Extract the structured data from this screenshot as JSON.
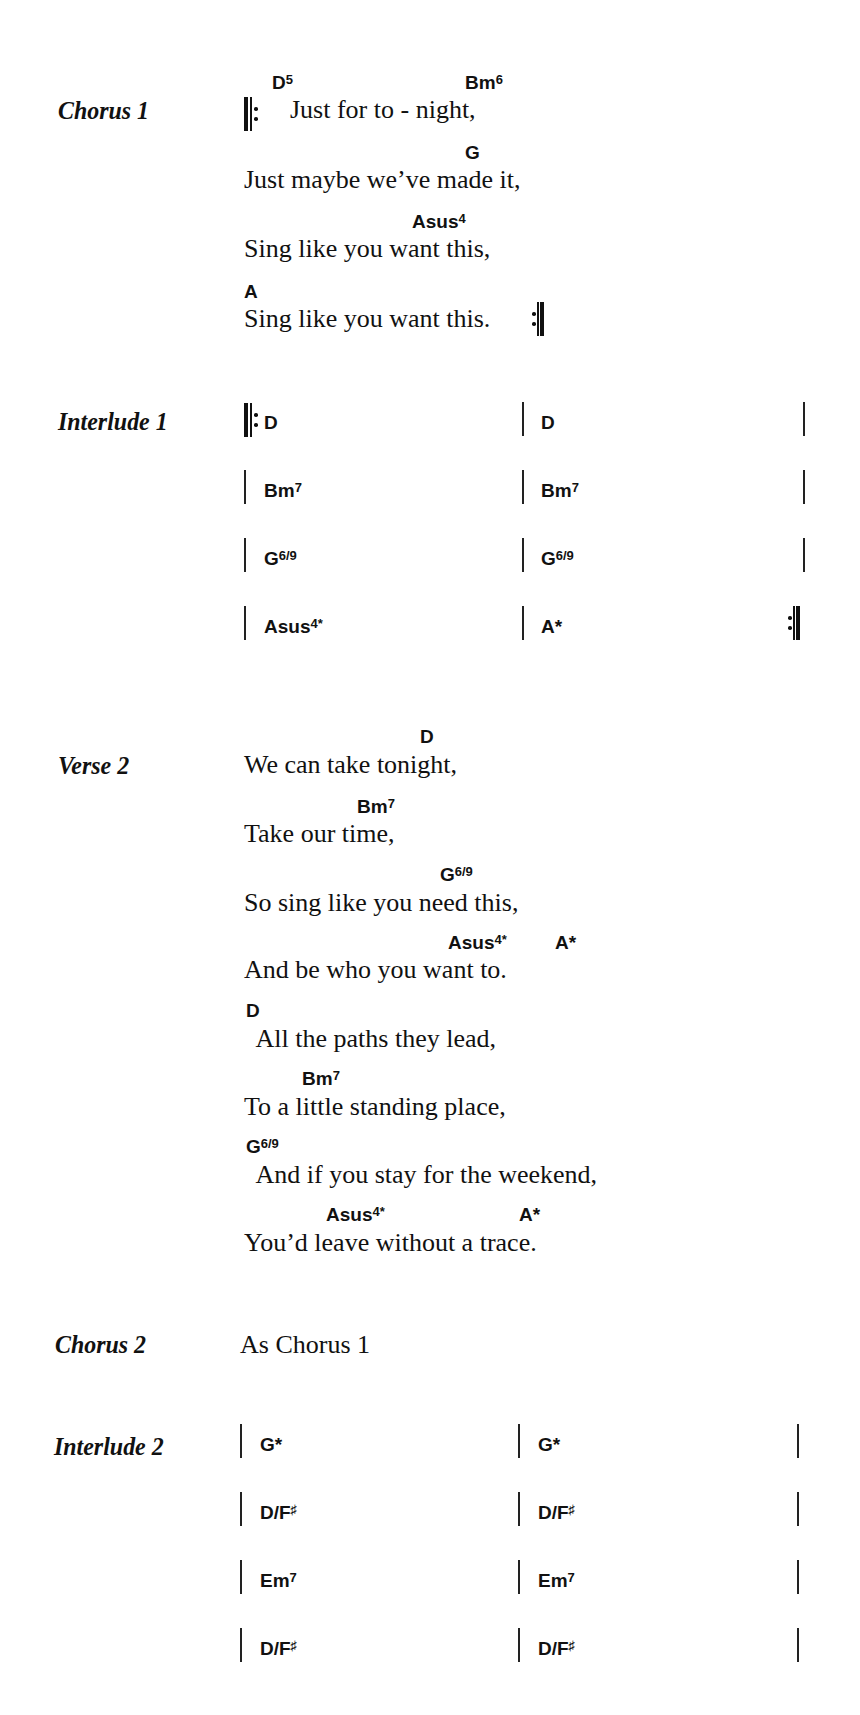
{
  "chorus1": {
    "label": "Chorus 1",
    "lines": [
      {
        "lyric": "Just for to - night,",
        "chords": [
          {
            "root": "D",
            "ext": "5"
          },
          {
            "root": "Bm",
            "ext": "6"
          }
        ]
      },
      {
        "lyric": "Just maybe we’ve made it,",
        "chords": [
          {
            "root": "G",
            "ext": ""
          }
        ]
      },
      {
        "lyric": "Sing like you want this,",
        "chords": [
          {
            "root": "Asus",
            "ext": "4"
          }
        ]
      },
      {
        "lyric": "Sing like you want this.",
        "chords": [
          {
            "root": "A",
            "ext": ""
          }
        ]
      }
    ]
  },
  "interlude1": {
    "label": "Interlude 1",
    "bars": [
      [
        {
          "root": "D",
          "ext": ""
        },
        {
          "root": "D",
          "ext": ""
        }
      ],
      [
        {
          "root": "Bm",
          "ext": "7"
        },
        {
          "root": "Bm",
          "ext": "7"
        }
      ],
      [
        {
          "root": "G",
          "ext": "6/9"
        },
        {
          "root": "G",
          "ext": "6/9"
        }
      ],
      [
        {
          "root": "Asus",
          "ext": "4*"
        },
        {
          "root": "A*",
          "ext": ""
        }
      ]
    ]
  },
  "verse2": {
    "label": "Verse 2",
    "lines": [
      {
        "lyric": "We can take tonight,",
        "chords": [
          {
            "root": "D",
            "ext": ""
          }
        ]
      },
      {
        "lyric": "Take our time,",
        "chords": [
          {
            "root": "Bm",
            "ext": "7"
          }
        ]
      },
      {
        "lyric": "So sing like you need this,",
        "chords": [
          {
            "root": "G",
            "ext": "6/9"
          }
        ]
      },
      {
        "lyric": "And be who you want to.",
        "chords": [
          {
            "root": "Asus",
            "ext": "4*"
          },
          {
            "root": "A*",
            "ext": ""
          }
        ]
      },
      {
        "lyric": "  All the paths they lead,",
        "chords": [
          {
            "root": "D",
            "ext": ""
          }
        ]
      },
      {
        "lyric": "To a little standing place,",
        "chords": [
          {
            "root": "Bm",
            "ext": "7"
          }
        ]
      },
      {
        "lyric": "  And if you stay for the weekend,",
        "chords": [
          {
            "root": "G",
            "ext": "6/9"
          }
        ]
      },
      {
        "lyric": "You’d leave without a trace.",
        "chords": [
          {
            "root": "Asus",
            "ext": "4*"
          },
          {
            "root": "A*",
            "ext": ""
          }
        ]
      }
    ]
  },
  "chorus2": {
    "label": "Chorus 2",
    "text": "As Chorus 1"
  },
  "interlude2": {
    "label": "Interlude 2",
    "bars": [
      [
        {
          "root": "G*",
          "ext": ""
        },
        {
          "root": "G*",
          "ext": ""
        }
      ],
      [
        {
          "root": "D/F",
          "ext": "♯"
        },
        {
          "root": "D/F",
          "ext": "♯"
        }
      ],
      [
        {
          "root": "Em",
          "ext": "7"
        },
        {
          "root": "Em",
          "ext": "7"
        }
      ],
      [
        {
          "root": "D/F",
          "ext": "♯"
        },
        {
          "root": "D/F",
          "ext": "♯"
        }
      ]
    ]
  }
}
